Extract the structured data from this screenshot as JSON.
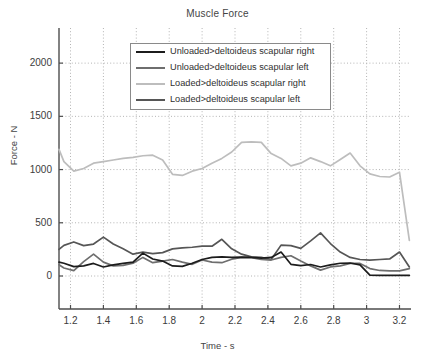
{
  "chart_data": {
    "type": "line",
    "title": "Muscle Force",
    "xlabel": "Time - s",
    "ylabel": "Force - N",
    "xlim": [
      1.13,
      3.27
    ],
    "ylim": [
      -310,
      2330
    ],
    "grid": true,
    "xticks": [
      "1.2",
      "1.4",
      "1.6",
      "1.8",
      "2",
      "2.2",
      "2.4",
      "2.6",
      "2.8",
      "3",
      "3.2"
    ],
    "xtick_values": [
      1.2,
      1.4,
      1.6,
      1.8,
      2.0,
      2.2,
      2.4,
      2.6,
      2.8,
      3.0,
      3.2
    ],
    "yticks": [
      "0",
      "500",
      "1000",
      "1500",
      "2000"
    ],
    "ytick_values": [
      0,
      500,
      1000,
      1500,
      2000
    ],
    "legend_position": "upper-center",
    "x": [
      1.13,
      1.16,
      1.22,
      1.28,
      1.34,
      1.4,
      1.46,
      1.52,
      1.58,
      1.64,
      1.7,
      1.76,
      1.82,
      1.88,
      1.94,
      2.0,
      2.06,
      2.12,
      2.18,
      2.24,
      2.3,
      2.36,
      2.42,
      2.48,
      2.54,
      2.6,
      2.66,
      2.72,
      2.78,
      2.84,
      2.9,
      2.96,
      3.02,
      3.08,
      3.14,
      3.2,
      3.26
    ],
    "series": [
      {
        "name": "Unloaded>deltoideus scapular right",
        "color": "#1c1c1c",
        "values": [
          130,
          120,
          88,
          95,
          118,
          85,
          105,
          118,
          130,
          215,
          160,
          140,
          95,
          90,
          120,
          155,
          175,
          180,
          175,
          178,
          175,
          168,
          175,
          225,
          110,
          98,
          108,
          85,
          105,
          120,
          122,
          105,
          8,
          5,
          5,
          5,
          5
        ]
      },
      {
        "name": "Unloaded>deltoideus scapular left",
        "color": "#6e6e6e",
        "values": [
          105,
          75,
          50,
          135,
          205,
          130,
          95,
          100,
          120,
          175,
          125,
          140,
          155,
          130,
          110,
          150,
          130,
          125,
          158,
          175,
          172,
          155,
          150,
          175,
          190,
          140,
          95,
          55,
          85,
          95,
          118,
          118,
          70,
          52,
          48,
          48,
          70
        ]
      },
      {
        "name": "Loaded>deltoideus scapular right",
        "color": "#bdbdbd",
        "values": [
          1190,
          1075,
          985,
          1010,
          1060,
          1075,
          1090,
          1105,
          1115,
          1130,
          1135,
          1090,
          955,
          945,
          985,
          1010,
          1060,
          1105,
          1165,
          1255,
          1260,
          1255,
          1150,
          1105,
          1035,
          1060,
          1110,
          1075,
          1035,
          1095,
          1155,
          1035,
          960,
          935,
          930,
          975,
          335
        ]
      },
      {
        "name": "Loaded>deltoideus scapular left",
        "color": "#565656",
        "values": [
          250,
          288,
          320,
          285,
          300,
          365,
          300,
          255,
          205,
          225,
          210,
          220,
          255,
          265,
          270,
          280,
          280,
          345,
          255,
          205,
          180,
          175,
          155,
          290,
          285,
          260,
          330,
          405,
          305,
          225,
          175,
          155,
          150,
          155,
          160,
          225,
          85
        ]
      }
    ]
  },
  "axes": {
    "title": "Muscle Force",
    "xlabel": "Time - s",
    "ylabel": "Force - N"
  },
  "legend": {
    "entries": [
      {
        "label": "Unloaded>deltoideus scapular right",
        "color": "#1c1c1c"
      },
      {
        "label": "Unloaded>deltoideus scapular left",
        "color": "#6e6e6e"
      },
      {
        "label": "Loaded>deltoideus scapular right",
        "color": "#bdbdbd"
      },
      {
        "label": "Loaded>deltoideus scapular left",
        "color": "#565656"
      }
    ]
  },
  "colors": {
    "axis": "#4d4d4d",
    "grid": "#b4b4b4",
    "background": "#ffffff",
    "text": "#3c3c3c"
  }
}
